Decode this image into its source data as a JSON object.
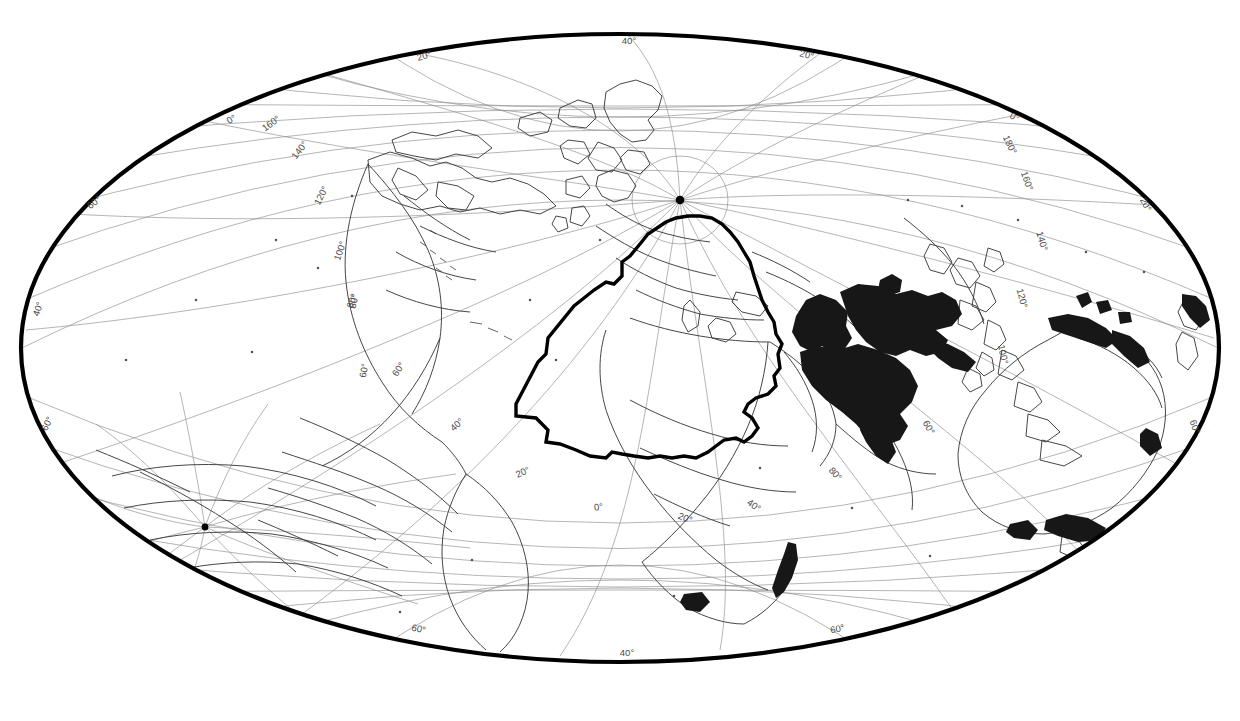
{
  "figure": {
    "kind": "world-map",
    "projection_name": "Hammer-Aitoff oblique world map",
    "background_color": "#ffffff",
    "outline_color": "#000000",
    "graticule_color": "#8d8d8d",
    "coastline_color": "#3c3c3c",
    "shaded_region_color": "#171717",
    "boundary_polygon_color": "#000000",
    "ellipse": {
      "cx": 620,
      "cy": 348,
      "rx": 601,
      "ry": 315,
      "outline_width": 4.0
    },
    "poles": [
      {
        "name": "north-pole-marker",
        "x": 680,
        "y": 200,
        "radius": 4.2
      },
      {
        "name": "south-pole-marker",
        "x": 205,
        "y": 527,
        "radius": 3.4
      }
    ],
    "graticule": {
      "visible": true,
      "meridian_step_deg": 20,
      "parallel_step_deg": 20,
      "line_width": 0.6
    }
  },
  "graticule_labels": [
    {
      "text": "40°",
      "x": 629,
      "y": 44,
      "rot": 0,
      "place": "top-center"
    },
    {
      "text": "20°",
      "x": 425,
      "y": 59,
      "rot": -16,
      "place": "top-left"
    },
    {
      "text": "20°",
      "x": 806,
      "y": 58,
      "rot": 14,
      "place": "top-right"
    },
    {
      "text": "0°",
      "x": 233,
      "y": 122,
      "rot": -30,
      "place": "upper-left"
    },
    {
      "text": "160°",
      "x": 273,
      "y": 126,
      "rot": -36,
      "place": "upper-left"
    },
    {
      "text": "140°",
      "x": 302,
      "y": 152,
      "rot": -52,
      "place": "upper-left"
    },
    {
      "text": "120°",
      "x": 324,
      "y": 197,
      "rot": -62,
      "place": "left"
    },
    {
      "text": "100°",
      "x": 343,
      "y": 252,
      "rot": -70,
      "place": "left"
    },
    {
      "text": "80°",
      "x": 357,
      "y": 302,
      "rot": -76,
      "place": "left"
    },
    {
      "text": "60°",
      "x": 367,
      "y": 371,
      "rot": -80,
      "place": "left"
    },
    {
      "text": "40°",
      "x": 41,
      "y": 310,
      "rot": -72,
      "place": "far-left"
    },
    {
      "text": "60°",
      "x": 50,
      "y": 425,
      "rot": -64,
      "place": "far-left"
    },
    {
      "text": "60°",
      "x": 96,
      "y": 205,
      "rot": -38,
      "place": "far-left-upper"
    },
    {
      "text": "0°",
      "x": 1013,
      "y": 120,
      "rot": 28,
      "place": "upper-right"
    },
    {
      "text": "180°",
      "x": 1007,
      "y": 146,
      "rot": 64,
      "place": "upper-right"
    },
    {
      "text": "160°",
      "x": 1024,
      "y": 182,
      "rot": 70,
      "place": "right"
    },
    {
      "text": "140°",
      "x": 1039,
      "y": 242,
      "rot": 74,
      "place": "right"
    },
    {
      "text": "120°",
      "x": 1019,
      "y": 299,
      "rot": 76,
      "place": "right"
    },
    {
      "text": "100°",
      "x": 1000,
      "y": 355,
      "rot": 78,
      "place": "right"
    },
    {
      "text": "20°",
      "x": 1143,
      "y": 206,
      "rot": 62,
      "place": "far-right"
    },
    {
      "text": "60°",
      "x": 1192,
      "y": 428,
      "rot": 70,
      "place": "far-right"
    },
    {
      "text": "60°",
      "x": 926,
      "y": 429,
      "rot": 60,
      "place": "right-inner"
    },
    {
      "text": "80°",
      "x": 833,
      "y": 476,
      "rot": 48,
      "place": "right-inner"
    },
    {
      "text": "40°",
      "x": 752,
      "y": 508,
      "rot": 36,
      "place": "inner"
    },
    {
      "text": "20°",
      "x": 684,
      "y": 521,
      "rot": 22,
      "place": "inner"
    },
    {
      "text": "0°",
      "x": 599,
      "y": 510,
      "rot": -8,
      "place": "inner"
    },
    {
      "text": "20°",
      "x": 524,
      "y": 475,
      "rot": -24,
      "place": "inner"
    },
    {
      "text": "40°",
      "x": 459,
      "y": 427,
      "rot": -42,
      "place": "inner"
    },
    {
      "text": "60°",
      "x": 401,
      "y": 371,
      "rot": -56,
      "place": "inner"
    },
    {
      "text": "80°",
      "x": 355,
      "y": 302,
      "rot": -70,
      "place": "inner"
    },
    {
      "text": "60°",
      "x": 418,
      "y": 632,
      "rot": 12,
      "place": "bottom-left"
    },
    {
      "text": "40°",
      "x": 627,
      "y": 656,
      "rot": 0,
      "place": "bottom-center"
    },
    {
      "text": "60°",
      "x": 838,
      "y": 632,
      "rot": -12,
      "place": "bottom-right"
    }
  ],
  "chart_data": {
    "type": "map",
    "title": "",
    "legend": [],
    "shaded_areas": [
      "south-asia-central-asia",
      "australia-coastal",
      "new-zealand",
      "madagascar-east-coast",
      "southern-africa-tip",
      "japan-kamchatka-fragments"
    ],
    "boundary_polygon_label": "study-region-outline"
  }
}
